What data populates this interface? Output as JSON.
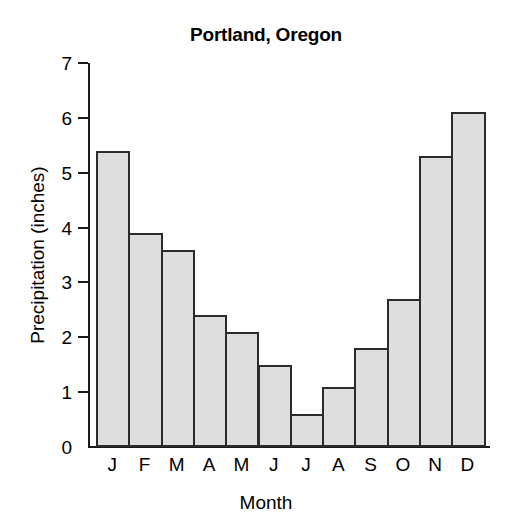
{
  "chart_data": {
    "type": "bar",
    "title": "Portland, Oregon",
    "xlabel": "Month",
    "ylabel": "Precipitation (inches)",
    "categories": [
      "J",
      "F",
      "M",
      "A",
      "M",
      "J",
      "J",
      "A",
      "S",
      "O",
      "N",
      "D"
    ],
    "category_names": [
      "January",
      "February",
      "March",
      "April",
      "May",
      "June",
      "July",
      "August",
      "September",
      "October",
      "November",
      "December"
    ],
    "values": [
      5.4,
      3.9,
      3.6,
      2.4,
      2.1,
      1.5,
      0.6,
      1.1,
      1.8,
      2.7,
      5.3,
      6.1
    ],
    "ylim": [
      0,
      7
    ],
    "yticks": [
      0,
      1,
      2,
      3,
      4,
      5,
      6,
      7
    ],
    "ytick_labels": [
      "0",
      "1",
      "2",
      "3",
      "4",
      "5",
      "6",
      "7"
    ],
    "grid": false,
    "legend": null,
    "bar_fill_color": "#dedede",
    "bar_edge_color": "#2b2b2b",
    "axis_color": "#1a1a1a",
    "background_color": "#ffffff"
  }
}
